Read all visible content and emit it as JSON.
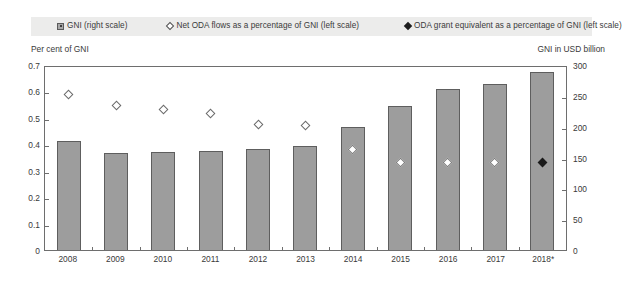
{
  "legend": {
    "items": [
      {
        "name": "gni-bar",
        "marker": "square-bar",
        "label": "GNI (right scale)"
      },
      {
        "name": "net-oda",
        "marker": "diamond-open",
        "label": "Net ODA flows as a percentage of GNI (left scale)"
      },
      {
        "name": "oda-grant-equivalent",
        "marker": "diamond-filled",
        "label": "ODA grant equivalent as a percentage of GNI (left scale)"
      }
    ]
  },
  "axes": {
    "left_caption": "Per cent of GNI",
    "right_caption": "GNI in USD billion",
    "left_ticks": [
      "0.7",
      "0.6",
      "0.5",
      "0.4",
      "0.3",
      "0.2",
      "0.1",
      "0"
    ],
    "right_ticks": [
      "300",
      "250",
      "200",
      "150",
      "100",
      "50",
      "0"
    ]
  },
  "colors": {
    "bar_fill": "#9d9d9d",
    "bar_border": "#5e5e5e",
    "frame": "#6e6e6e",
    "legend_background": "#ececeb",
    "text": "#3a3a3a",
    "marker_filled": "#1a1a1a"
  },
  "chart_data": {
    "type": "bar",
    "title": "",
    "xlabel": "",
    "ylabel": "Per cent of GNI",
    "y2label": "GNI in USD billion",
    "grid": false,
    "legend_position": "top",
    "categories": [
      "2008",
      "2009",
      "2010",
      "2011",
      "2012",
      "2013",
      "2014",
      "2015",
      "2016",
      "2017",
      "2018*"
    ],
    "ylim": [
      0,
      0.7
    ],
    "y2lim": [
      0,
      300
    ],
    "series": [
      {
        "name": "GNI (right scale)",
        "type": "bar",
        "axis": "right",
        "unit": "USD billion",
        "values": [
          177,
          158,
          159,
          160,
          164,
          168,
          200,
          233,
          261,
          270,
          288
        ]
      },
      {
        "name": "Net ODA flows as a percentage of GNI (left scale)",
        "type": "scatter",
        "axis": "left",
        "marker": "diamond-open",
        "unit": "per cent of GNI",
        "values": [
          0.59,
          0.545,
          0.53,
          0.515,
          0.475,
          0.47,
          0.38,
          0.33,
          0.33,
          0.33,
          null
        ]
      },
      {
        "name": "ODA grant equivalent as a percentage of GNI (left scale)",
        "type": "scatter",
        "axis": "left",
        "marker": "diamond-filled",
        "unit": "per cent of GNI",
        "values": [
          null,
          null,
          null,
          null,
          null,
          null,
          null,
          null,
          null,
          null,
          0.33
        ]
      }
    ]
  }
}
